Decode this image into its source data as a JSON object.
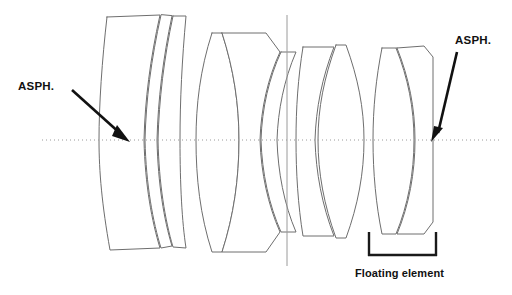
{
  "figure": {
    "kind": "optical-lens-cross-section-diagram",
    "background_color": "#ffffff",
    "outline_color": "#6e6e6e",
    "annotation_color": "#111111",
    "axis_color": "#9a9a9a",
    "width": 512,
    "height": 295
  },
  "annotations": {
    "aspherical_left_label": "ASPH.",
    "aspherical_right_label": "ASPH.",
    "floating_element_label": "Floating element"
  },
  "optical_axis": {
    "label": "optical-axis",
    "y": 140,
    "x_start": 42,
    "x_end": 500,
    "style": "dotted"
  },
  "aperture_stop": {
    "label": "aperture-stop",
    "x": 287,
    "y_top": 15,
    "y_bottom": 266
  },
  "elements": [
    {
      "index": 1,
      "name": "element-1-meniscus",
      "group": "front-group",
      "shape": "negative-meniscus",
      "aspherical": false
    },
    {
      "index": 2,
      "name": "element-2-meniscus-asph",
      "group": "front-group",
      "shape": "negative-meniscus",
      "aspherical": true
    },
    {
      "index": 3,
      "name": "element-3-meniscus",
      "group": "front-group",
      "shape": "negative-meniscus",
      "aspherical": false
    },
    {
      "index": 4,
      "name": "element-4-biconvex",
      "group": "second-group",
      "shape": "biconvex",
      "aspherical": false
    },
    {
      "index": 5,
      "name": "element-5-meniscus",
      "group": "second-group",
      "shape": "positive-meniscus",
      "aspherical": false
    },
    {
      "index": 6,
      "name": "element-6-biconcave",
      "group": "second-group",
      "shape": "biconcave",
      "aspherical": false
    },
    {
      "index": 7,
      "name": "element-7-biconvex",
      "group": "rear-group",
      "shape": "biconvex",
      "aspherical": false
    },
    {
      "index": 8,
      "name": "element-8-biconvex",
      "group": "rear-group",
      "shape": "biconvex",
      "aspherical": false
    },
    {
      "index": 9,
      "name": "element-9-biconvex",
      "group": "floating-group",
      "shape": "biconvex",
      "aspherical": false
    },
    {
      "index": 10,
      "name": "element-10-meniscus-asph",
      "group": "floating-group",
      "shape": "negative-meniscus",
      "aspherical": true
    }
  ],
  "floating_element_bracket": {
    "x_left": 368,
    "x_right": 436,
    "y_top": 232,
    "y_bottom": 256
  },
  "leaders": {
    "left": {
      "from_x": 72,
      "from_y": 90,
      "to_x": 128,
      "to_y": 140
    },
    "right": {
      "from_x": 455,
      "from_y": 51,
      "to_x": 433,
      "to_y": 140
    }
  }
}
